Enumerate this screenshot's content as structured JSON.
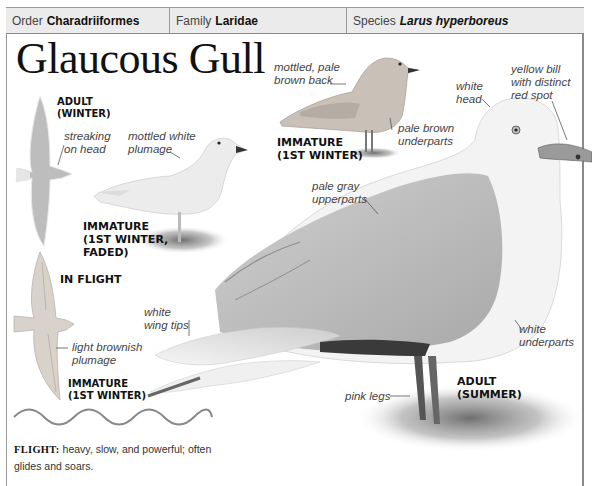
{
  "header": {
    "order": {
      "label": "Order",
      "value": "Charadriiformes"
    },
    "family": {
      "label": "Family",
      "value": "Laridae"
    },
    "species": {
      "label": "Species",
      "value": "Larus hyperboreus"
    }
  },
  "title": "Glaucous Gull",
  "illustrations": {
    "adult_winter_flight": {
      "label_line1": "ADULT",
      "label_line2": "(WINTER)",
      "caption_line1": "streaking",
      "caption_line2": "on head"
    },
    "immature_faded": {
      "caption_line1": "mottled white",
      "caption_line2": "plumage",
      "label_line1": "IMMATURE",
      "label_line2": "(1ST WINTER,",
      "label_line3": "FADED)"
    },
    "immature_1st_winter": {
      "caption_back_line1": "mottled, pale",
      "caption_back_line2": "brown back",
      "caption_under_line1": "pale brown",
      "caption_under_line2": "underparts",
      "label_line1": "IMMATURE",
      "label_line2": "(1ST WINTER)"
    },
    "in_flight": {
      "section_label": "IN FLIGHT",
      "caption_line1": "light brownish",
      "caption_line2": "plumage",
      "label_line1": "IMMATURE",
      "label_line2": "(1ST WINTER)"
    },
    "adult_summer": {
      "head_line1": "white",
      "head_line2": "head",
      "bill_line1": "yellow bill",
      "bill_line2": "with distinct",
      "bill_line3": "red spot",
      "upper_line1": "pale gray",
      "upper_line2": "upperparts",
      "wing_line1": "white",
      "wing_line2": "wing tips",
      "under_line1": "white",
      "under_line2": "underparts",
      "legs": "pink legs",
      "label_line1": "ADULT",
      "label_line2": "(SUMMER)"
    }
  },
  "flight": {
    "keyword": "FLIGHT:",
    "description": "heavy, slow, and powerful; often glides and soars."
  },
  "colors": {
    "header_bg": "#ebebeb",
    "border": "#9a9a9a",
    "gull_gray": "#b8b8b8",
    "gull_white": "#f2f2f2"
  }
}
